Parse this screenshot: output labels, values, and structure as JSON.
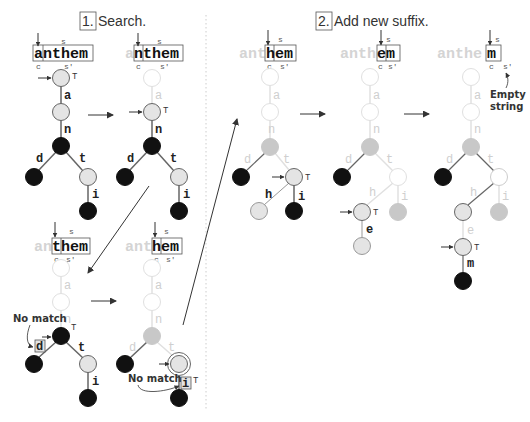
{
  "titles": {
    "step1_number": "1.",
    "step1_label": "Search.",
    "step2_number": "2.",
    "step2_label": "Add new suffix."
  },
  "colors": {
    "black_node": "#111111",
    "light_node": "#e4e4e4",
    "gray_node": "#c8c8c8",
    "faded_node_stroke": "#e0e0e0",
    "node_stroke": "#666666",
    "faded_text": "#d4d4d4",
    "edge": "#666666",
    "faded_edge": "#e0e0e0",
    "divider": "#cccccc"
  },
  "pointer_labels": {
    "s": "s",
    "c": "c",
    "s_prime": "s'",
    "T": "T"
  },
  "annotations": {
    "no_match": "No match",
    "empty_string_line1": "Empty",
    "empty_string_line2": "string"
  },
  "panels": [
    {
      "id": "search-1",
      "faded_prefix": "",
      "active_word": "anthem",
      "edges": [
        "a",
        "n",
        "d",
        "t",
        "i"
      ]
    },
    {
      "id": "search-2",
      "faded_prefix": "a",
      "active_word": "nthem",
      "edges": [
        "a",
        "n",
        "d",
        "t",
        "i"
      ]
    },
    {
      "id": "search-3",
      "faded_prefix": "an",
      "active_word": "them",
      "edges": [
        "a",
        "n",
        "d",
        "t",
        "i"
      ],
      "note": "No match"
    },
    {
      "id": "search-4",
      "faded_prefix": "ant",
      "active_word": "hem",
      "edges": [
        "a",
        "n",
        "d",
        "t",
        "i"
      ],
      "note": "No match"
    },
    {
      "id": "add-1",
      "faded_prefix": "ant",
      "active_word": "hem",
      "edges": [
        "a",
        "n",
        "d",
        "t",
        "h",
        "i"
      ]
    },
    {
      "id": "add-2",
      "faded_prefix": "anth",
      "active_word": "em",
      "edges": [
        "a",
        "n",
        "d",
        "t",
        "h",
        "i",
        "e"
      ]
    },
    {
      "id": "add-3",
      "faded_prefix": "anthe",
      "active_word": "m",
      "edges": [
        "a",
        "n",
        "d",
        "t",
        "h",
        "i",
        "e",
        "m"
      ],
      "note": "Empty string"
    }
  ]
}
